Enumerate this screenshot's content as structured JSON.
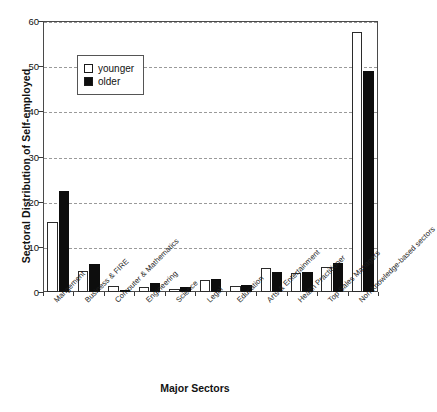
{
  "chart_data": {
    "type": "bar",
    "title": "",
    "xlabel": "Major Sectors",
    "ylabel": "Sectoral Distribution of Self-employed",
    "ylim": [
      0,
      60
    ],
    "yticks": [
      0,
      10,
      20,
      30,
      40,
      50,
      60
    ],
    "grid": true,
    "legend_position": "upper-left-inside",
    "categories": [
      "Mangement",
      "Business & FIRE",
      "Computer & Mathematics",
      "Engineering",
      "Science",
      "Legal",
      "Education",
      "Arts & Entertainment",
      "Health Practitioner",
      "Top Sales Managers",
      "Non-knowledge-based sectors"
    ],
    "series": [
      {
        "name": "younger",
        "color": "#ffffff",
        "values": [
          15.5,
          4.7,
          1.4,
          1.2,
          0.7,
          2.6,
          1.3,
          5.3,
          4.2,
          5.6,
          57.5
        ]
      },
      {
        "name": "older",
        "color": "#0d0d0d",
        "values": [
          22.4,
          6.3,
          0.5,
          2.1,
          1.2,
          2.8,
          1.6,
          4.4,
          4.5,
          6.4,
          49.0
        ]
      }
    ]
  },
  "legend": {
    "items": [
      {
        "label": "younger",
        "swatch": "open-square-swatch"
      },
      {
        "label": "older",
        "swatch": "filled-square-swatch"
      }
    ]
  },
  "axes": {
    "y_title": "Sectoral Distribution of Self-employed",
    "x_title": "Major Sectors",
    "y_tick_labels": [
      "0",
      "10",
      "20",
      "30",
      "40",
      "50",
      "60"
    ]
  }
}
